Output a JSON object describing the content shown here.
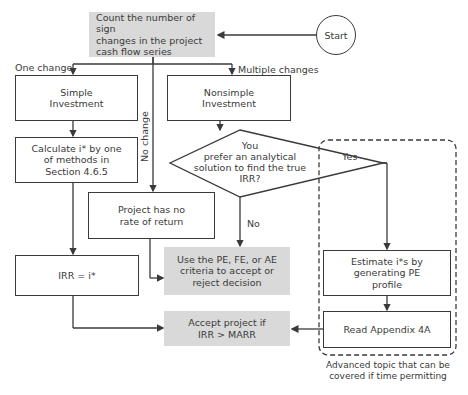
{
  "diagram": {
    "start": {
      "label": "Start"
    },
    "count": {
      "text_lines": [
        "Count the number of sign",
        "changes in the project",
        "cash flow series"
      ]
    },
    "branch_labels": {
      "one_change": "One change",
      "multiple_changes": "Multiple changes",
      "no_change": "No change",
      "yes": "Yes",
      "no": "No"
    },
    "simple": {
      "text_lines": [
        "Simple",
        "Investment"
      ]
    },
    "nonsimple": {
      "text_lines": [
        "Nonsimple",
        "Investment"
      ]
    },
    "calculate": {
      "text_lines": [
        "Calculate i* by one",
        "of methods in",
        "Section 4.6.5"
      ]
    },
    "decision": {
      "text_lines": [
        "You",
        "prefer an analytical",
        "solution to find the true",
        "IRR?"
      ]
    },
    "no_return": {
      "text_lines": [
        "Project has no",
        "rate of return"
      ]
    },
    "irr_equals": {
      "text": "IRR = i*"
    },
    "use_pe": {
      "text_lines": [
        "Use the PE, FE, or AE",
        "criteria to accept or",
        "reject decision"
      ]
    },
    "accept": {
      "text_lines": [
        "Accept project if",
        "IRR > MARR"
      ]
    },
    "estimate": {
      "text_lines": [
        "Estimate i*s by",
        "generating PE",
        "profile"
      ]
    },
    "appendix": {
      "text": "Read Appendix 4A"
    },
    "advanced_note": {
      "text_lines": [
        "Advanced topic that can be",
        "covered if time permitting"
      ]
    },
    "colors": {
      "line": "#3a3a3a",
      "gray_fill": "#d9d9d9",
      "background": "#ffffff"
    }
  }
}
